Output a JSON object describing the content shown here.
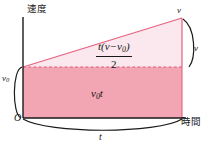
{
  "figure": {
    "title_alt": "Velocity-time graph showing displacement as area",
    "axes": {
      "y_label": "速度",
      "x_label": "時間",
      "origin_label": "O"
    },
    "labels": {
      "v0_axis": "v",
      "v0_axis_sub": "0",
      "v_apex": "v",
      "v_brace": "v",
      "t_brace": "t"
    },
    "regions": {
      "rectangle": {
        "name": "v0t",
        "main": "v",
        "sub": "0",
        "tail": "t"
      },
      "triangle": {
        "numerator_pre": "t(",
        "numerator_v": "v",
        "numerator_minus": "−",
        "numerator_v0": "v",
        "numerator_v0_sub": "0",
        "numerator_post": ")",
        "denominator": "2"
      }
    },
    "colors": {
      "rect_fill": "#f2a5b2",
      "tri_fill": "#fae8ee",
      "line_pink": "#e8607f",
      "axis_black": "#1a1a1a",
      "background": "#ffffff"
    },
    "geometry": {
      "x_origin": 23,
      "x_end": 182,
      "y_top_apex": 18,
      "y_v0": 67,
      "y_baseline": 118
    }
  }
}
